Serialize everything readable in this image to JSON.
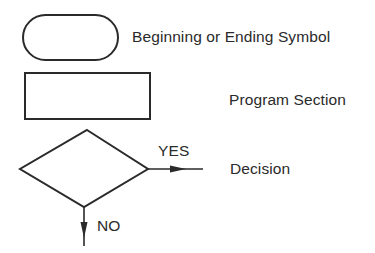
{
  "legend": {
    "items": [
      {
        "shape": "rounded-rectangle",
        "label": "Beginning or Ending Symbol"
      },
      {
        "shape": "rectangle",
        "label": "Program Section"
      },
      {
        "shape": "diamond",
        "label": "Decision"
      }
    ]
  },
  "decision": {
    "yes_label": "YES",
    "no_label": "NO"
  },
  "colors": {
    "stroke": "#2a2a2a",
    "background": "#ffffff"
  }
}
